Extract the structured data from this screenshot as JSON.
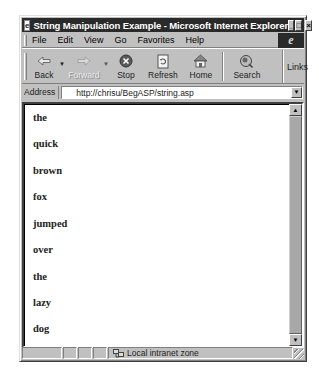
{
  "window": {
    "title": "String Manipulation Example - Microsoft Internet Explorer",
    "controls": {
      "minimize": "_",
      "maximize": "□",
      "close": "×"
    }
  },
  "menubar": {
    "items": [
      {
        "label": "File",
        "accel": "F"
      },
      {
        "label": "Edit",
        "accel": "E"
      },
      {
        "label": "View",
        "accel": "V"
      },
      {
        "label": "Go",
        "accel": "G"
      },
      {
        "label": "Favorites",
        "accel": "a"
      },
      {
        "label": "Help",
        "accel": "H"
      }
    ],
    "logo": "e"
  },
  "toolbar": {
    "back": "Back",
    "forward": "Forward",
    "stop": "Stop",
    "refresh": "Refresh",
    "home": "Home",
    "search": "Search",
    "links": "Links"
  },
  "address": {
    "label": "Address",
    "url": "http://chrisu/BegASP/string.asp"
  },
  "page": {
    "words": [
      "the",
      "quick",
      "brown",
      "fox",
      "jumped",
      "over",
      "the",
      "lazy",
      "dog"
    ]
  },
  "status": {
    "zone": "Local intranet zone"
  },
  "colors": {
    "chrome": "#c0c0c0",
    "titlebar": "#2a2a2a",
    "content_bg": "#ffffff",
    "text": "#222222"
  }
}
